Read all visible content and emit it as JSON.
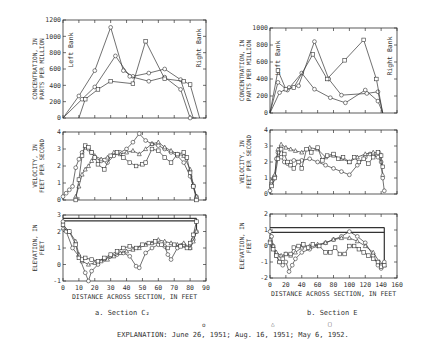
{
  "explanation": {
    "label": "EXPLANATION:",
    "text": "June 26, 1951; Aug. 16, 1951; May 6, 1952.",
    "legend": [
      {
        "date": "June 26, 1951",
        "marker": "circle"
      },
      {
        "date": "Aug. 16, 1951",
        "marker": "triangle"
      },
      {
        "date": "May 6, 1952",
        "marker": "square"
      }
    ]
  },
  "captions": {
    "a": "a.  Section C₂",
    "b": "b.  Section E"
  },
  "chart_data": [
    {
      "panel": "a",
      "title": "Section C2",
      "type": "line",
      "metric": "concentration",
      "ylabel": "CONCENTRATION, IN PARTS PER MILLION",
      "xlabel": "",
      "xlim": [
        0,
        90
      ],
      "ylim": [
        0,
        1200
      ],
      "yticks": [
        0,
        200,
        400,
        600,
        800,
        1000,
        1200
      ],
      "annotations": [
        "Left Bank",
        "Right Bank"
      ],
      "series": [
        {
          "name": "June 26, 1951",
          "marker": "circle",
          "x": [
            0,
            10,
            20,
            30,
            38,
            44,
            54,
            64,
            74,
            82
          ],
          "y": [
            0,
            270,
            580,
            1110,
            580,
            510,
            550,
            600,
            470,
            0
          ]
        },
        {
          "name": "Aug. 16, 1951",
          "marker": "circle",
          "x": [
            0,
            12,
            20,
            33,
            42,
            54,
            64,
            74,
            80,
            84
          ],
          "y": [
            0,
            230,
            380,
            760,
            510,
            450,
            500,
            350,
            0,
            0
          ]
        },
        {
          "name": "May 6, 1952",
          "marker": "square",
          "x": [
            10,
            14,
            22,
            30,
            44,
            52,
            64,
            76,
            80,
            86
          ],
          "y": [
            0,
            230,
            350,
            450,
            420,
            940,
            480,
            450,
            410,
            0
          ]
        }
      ]
    },
    {
      "panel": "a",
      "title": "Section C2",
      "type": "line",
      "metric": "velocity",
      "ylabel": "VELOCITY, IN FEET PER SECOND",
      "xlabel": "",
      "xlim": [
        0,
        90
      ],
      "ylim": [
        0,
        4
      ],
      "yticks": [
        0,
        1,
        2,
        3,
        4
      ],
      "series": [
        {
          "name": "June 26, 1951",
          "marker": "circle",
          "x": [
            0,
            2,
            4,
            6,
            8,
            10,
            12,
            14,
            16,
            18,
            20,
            24,
            28,
            32,
            36,
            40,
            44,
            48,
            52,
            56,
            60,
            64,
            68,
            72,
            76,
            80,
            82,
            84
          ],
          "y": [
            0.2,
            0.4,
            0.6,
            0.8,
            1.9,
            2.4,
            2.8,
            3.1,
            3.0,
            2.8,
            2.5,
            2.3,
            2.2,
            2.6,
            2.8,
            3.0,
            3.4,
            3.9,
            3.5,
            3.3,
            3.2,
            3.0,
            2.8,
            2.6,
            2.2,
            1.4,
            0.8,
            0.2
          ]
        },
        {
          "name": "Aug. 16, 1951",
          "marker": "triangle",
          "x": [
            8,
            10,
            12,
            14,
            16,
            18,
            20,
            24,
            28,
            32,
            36,
            40,
            44,
            48,
            52,
            56,
            60,
            64,
            68,
            72,
            76,
            80,
            82,
            84
          ],
          "y": [
            0.2,
            0.8,
            1.5,
            1.8,
            2.0,
            2.3,
            2.6,
            2.4,
            2.5,
            2.8,
            2.7,
            2.8,
            2.9,
            2.7,
            3.0,
            3.3,
            3.4,
            3.1,
            2.9,
            2.7,
            2.6,
            1.8,
            0.9,
            0.2
          ]
        },
        {
          "name": "May 6, 1952",
          "marker": "square",
          "x": [
            8,
            10,
            12,
            14,
            16,
            18,
            20,
            22,
            26,
            30,
            34,
            38,
            42,
            46,
            50,
            52,
            56,
            60,
            64,
            68,
            72,
            76,
            78,
            80,
            82,
            84
          ],
          "y": [
            0,
            1.2,
            2.6,
            3.2,
            3.1,
            2.8,
            2.5,
            2.1,
            1.8,
            2.6,
            2.8,
            2.5,
            2.2,
            2.0,
            2.1,
            2.2,
            3.0,
            2.9,
            2.5,
            2.2,
            2.7,
            2.8,
            2.5,
            1.6,
            0.8,
            0.0
          ]
        }
      ]
    },
    {
      "panel": "a",
      "title": "Section C2",
      "type": "line",
      "metric": "elevation",
      "ylabel": "ELEVATION, IN FEET",
      "xlabel": "DISTANCE ACROSS SECTION, IN FEET",
      "xlim": [
        0,
        90
      ],
      "ylim": [
        -1,
        3
      ],
      "yticks": [
        -1,
        0,
        1,
        2,
        3
      ],
      "xticks": [
        0,
        10,
        20,
        30,
        40,
        50,
        60,
        70,
        80,
        90
      ],
      "water_surface": [
        {
          "y": 2.8,
          "x0": 0,
          "x1": 84
        },
        {
          "y": 2.65,
          "x0": 0,
          "x1": 84
        }
      ],
      "series": [
        {
          "name": "June 26, 1951",
          "marker": "circle",
          "x": [
            0,
            2,
            6,
            10,
            14,
            16,
            18,
            22,
            26,
            30,
            34,
            38,
            42,
            46,
            48,
            52,
            56,
            60,
            64,
            66,
            68,
            72,
            76,
            80,
            82,
            84
          ],
          "y": [
            2.6,
            2.0,
            1.0,
            0.5,
            -0.5,
            -1.0,
            -0.4,
            0.0,
            0.3,
            0.5,
            0.6,
            0.7,
            0.5,
            -0.1,
            -0.2,
            0.7,
            1.0,
            1.2,
            1.1,
            0.6,
            0.3,
            1.0,
            1.2,
            1.0,
            1.5,
            2.0
          ]
        },
        {
          "name": "Aug. 16, 1951",
          "marker": "triangle",
          "x": [
            0,
            4,
            8,
            10,
            12,
            16,
            20,
            24,
            28,
            32,
            36,
            40,
            44,
            48,
            52,
            56,
            60,
            64,
            68,
            72,
            76,
            80,
            82,
            84
          ],
          "y": [
            2.2,
            2.0,
            1.4,
            0.6,
            0.2,
            0.0,
            0.1,
            0.2,
            0.3,
            0.5,
            0.7,
            0.8,
            0.9,
            1.0,
            1.2,
            1.3,
            1.5,
            1.4,
            1.3,
            1.2,
            1.3,
            1.0,
            1.4,
            2.0
          ]
        },
        {
          "name": "May 6, 1952",
          "marker": "square",
          "x": [
            0,
            4,
            8,
            10,
            12,
            14,
            18,
            22,
            26,
            30,
            34,
            38,
            42,
            46,
            50,
            54,
            58,
            62,
            66,
            70,
            74,
            78,
            80,
            82,
            84
          ],
          "y": [
            2.4,
            2.0,
            1.2,
            0.4,
            0.3,
            0.4,
            0.3,
            0.2,
            0.4,
            0.6,
            0.8,
            1.0,
            1.1,
            1.0,
            1.2,
            1.3,
            1.4,
            1.2,
            1.0,
            1.2,
            1.1,
            1.0,
            1.3,
            1.8,
            2.6
          ]
        }
      ]
    },
    {
      "panel": "b",
      "title": "Section E",
      "type": "line",
      "metric": "concentration",
      "ylabel": "CONCENTRATION, IN PARTS PER MILLION",
      "xlabel": "",
      "xlim": [
        0,
        160
      ],
      "ylim": [
        0,
        1000
      ],
      "yticks": [
        0,
        200,
        400,
        600,
        800,
        1000
      ],
      "annotations": [
        "Left Bank",
        "Right Bank"
      ],
      "series": [
        {
          "name": "June 26, 1951",
          "marker": "circle",
          "x": [
            0,
            10,
            22,
            40,
            56,
            76,
            95,
            120,
            136,
            142
          ],
          "y": [
            0,
            360,
            270,
            470,
            280,
            180,
            120,
            270,
            140,
            0
          ]
        },
        {
          "name": "Aug. 16, 1951",
          "marker": "circle",
          "x": [
            0,
            12,
            24,
            36,
            56,
            74,
            90,
            122,
            136,
            142
          ],
          "y": [
            0,
            240,
            300,
            320,
            840,
            400,
            210,
            230,
            250,
            0
          ]
        },
        {
          "name": "May 6, 1952",
          "marker": "square",
          "x": [
            0,
            10,
            20,
            30,
            54,
            72,
            94,
            118,
            134,
            142
          ],
          "y": [
            0,
            500,
            280,
            300,
            690,
            400,
            620,
            860,
            400,
            0
          ]
        }
      ]
    },
    {
      "panel": "b",
      "title": "Section E",
      "type": "line",
      "metric": "velocity",
      "ylabel": "VELOCITY, IN FEET PER SECOND",
      "xlabel": "",
      "xlim": [
        0,
        160
      ],
      "ylim": [
        0,
        4
      ],
      "yticks": [
        0,
        1,
        2,
        3,
        4
      ],
      "series": [
        {
          "name": "June 26, 1951",
          "marker": "circle",
          "x": [
            0,
            2,
            4,
            6,
            8,
            10,
            14,
            18,
            22,
            26,
            30,
            40,
            50,
            60,
            70,
            80,
            90,
            100,
            110,
            120,
            126,
            130,
            136,
            140,
            142,
            144
          ],
          "y": [
            0.2,
            0.6,
            0.9,
            1.1,
            2.2,
            2.6,
            2.3,
            2.0,
            1.9,
            2.0,
            2.1,
            2.1,
            2.2,
            2.0,
            1.8,
            1.6,
            1.4,
            1.2,
            1.8,
            2.3,
            2.5,
            2.4,
            2.3,
            2.0,
            1.0,
            0.2
          ]
        },
        {
          "name": "Aug. 16, 1951",
          "marker": "triangle",
          "x": [
            2,
            6,
            10,
            14,
            20,
            26,
            32,
            40,
            50,
            60,
            70,
            80,
            90,
            100,
            110,
            120,
            130,
            138,
            142
          ],
          "y": [
            0.8,
            1.2,
            2.8,
            3.1,
            2.9,
            2.8,
            2.7,
            2.6,
            2.9,
            2.8,
            2.3,
            2.4,
            2.2,
            2.0,
            2.3,
            2.5,
            2.6,
            2.6,
            1.2
          ]
        },
        {
          "name": "May 6, 1952",
          "marker": "square",
          "x": [
            2,
            6,
            10,
            14,
            18,
            22,
            26,
            30,
            36,
            40,
            46,
            52,
            60,
            66,
            72,
            80,
            86,
            92,
            100,
            106,
            112,
            118,
            124,
            130,
            136,
            140,
            142
          ],
          "y": [
            0.5,
            1.0,
            2.2,
            2.8,
            2.5,
            2.0,
            1.8,
            1.6,
            2.0,
            1.6,
            2.8,
            2.6,
            2.9,
            2.1,
            2.4,
            2.5,
            2.2,
            2.3,
            2.0,
            2.3,
            2.0,
            2.2,
            1.9,
            2.3,
            2.6,
            2.4,
            1.7
          ]
        }
      ]
    },
    {
      "panel": "b",
      "title": "Section E",
      "type": "line",
      "metric": "elevation",
      "ylabel": "ELEVATION, IN FEET",
      "xlabel": "DISTANCE ACROSS SECTION, IN FEET",
      "xlim": [
        0,
        160
      ],
      "ylim": [
        -2,
        2
      ],
      "yticks": [
        -2,
        -1,
        0,
        1,
        2
      ],
      "xticks": [
        0,
        20,
        40,
        60,
        80,
        100,
        120,
        140,
        160
      ],
      "water_surface": [
        {
          "y": 1.15,
          "x0": 0,
          "x1": 144
        },
        {
          "y": 0.85,
          "x0": 0,
          "x1": 144
        }
      ],
      "series": [
        {
          "name": "June 26, 1951",
          "marker": "circle",
          "x": [
            0,
            2,
            4,
            8,
            12,
            16,
            20,
            24,
            28,
            32,
            40,
            50,
            60,
            70,
            80,
            90,
            100,
            110,
            120,
            130,
            136,
            140,
            144
          ],
          "y": [
            0.9,
            0.6,
            0.0,
            -0.6,
            -1.0,
            -1.2,
            -1.0,
            -1.6,
            -1.2,
            -0.8,
            -0.4,
            -0.2,
            0.0,
            0.2,
            0.4,
            0.6,
            0.9,
            0.6,
            0.2,
            -0.6,
            -1.2,
            -1.4,
            -1.0
          ]
        },
        {
          "name": "Aug. 16, 1951",
          "marker": "triangle",
          "x": [
            0,
            4,
            8,
            14,
            20,
            26,
            32,
            40,
            50,
            60,
            70,
            80,
            90,
            100,
            110,
            120,
            130,
            138,
            144
          ],
          "y": [
            0.4,
            0.0,
            -0.4,
            -0.6,
            -0.5,
            -0.6,
            -0.4,
            -0.1,
            0.0,
            0.1,
            0.2,
            0.4,
            0.5,
            0.5,
            0.3,
            0.0,
            -0.4,
            -1.0,
            -1.2
          ]
        },
        {
          "name": "May 6, 1952",
          "marker": "square",
          "x": [
            0,
            4,
            8,
            12,
            16,
            20,
            26,
            30,
            36,
            42,
            48,
            54,
            62,
            70,
            76,
            82,
            88,
            94,
            100,
            106,
            112,
            118,
            124,
            130,
            136,
            140,
            144
          ],
          "y": [
            0.2,
            -0.2,
            -0.6,
            -1.0,
            -0.8,
            -0.5,
            -0.5,
            -0.1,
            0.0,
            0.1,
            -0.1,
            0.1,
            0.0,
            -0.4,
            -0.4,
            -0.1,
            -0.5,
            -0.5,
            0.0,
            0.0,
            -0.2,
            -0.4,
            -0.6,
            -0.8,
            -1.0,
            -1.3,
            -1.2
          ]
        }
      ]
    }
  ]
}
